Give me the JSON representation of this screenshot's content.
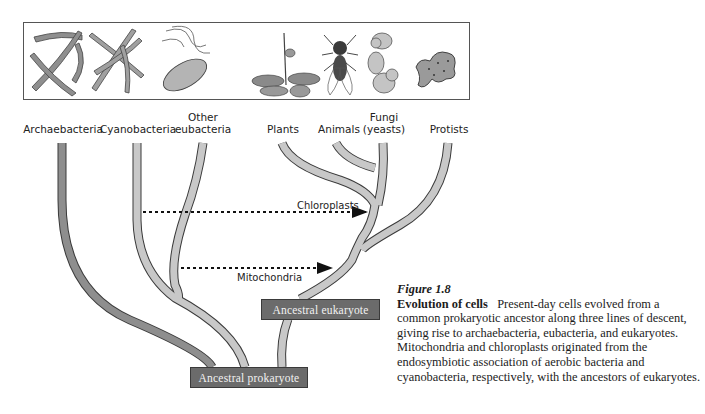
{
  "figure": {
    "number": "Figure 1.8",
    "title": "Evolution of cells",
    "caption": "Present-day cells evolved from a common prokaryotic ancestor along three lines of descent, giving rise to archaebacteria, eubacteria, and eukaryotes. Mitochondria and chloroplasts originated from the endosymbiotic association of aerobic bacteria and cyanobacteria, respectively, with the ancestors of eukaryotes."
  },
  "organism_panel": {
    "illustrations": [
      {
        "name": "archaebacteria-filaments",
        "icon": "filament-chain-icon"
      },
      {
        "name": "cyanobacteria-filaments",
        "icon": "bead-chain-icon"
      },
      {
        "name": "flagellated-bacterium",
        "icon": "rod-bacterium-icon"
      },
      {
        "name": "plant",
        "icon": "plant-icon"
      },
      {
        "name": "fruit-fly",
        "icon": "fly-icon"
      },
      {
        "name": "yeast-cells",
        "icon": "yeast-icon"
      },
      {
        "name": "amoeba",
        "icon": "amoeba-icon"
      }
    ]
  },
  "tree": {
    "leaves": [
      {
        "label": "Archaebacteria",
        "x": 63
      },
      {
        "label": "Cyanobacteria",
        "x": 138
      },
      {
        "label": "Other\neubacteria",
        "line1": "Other",
        "line2": "eubacteria",
        "x": 203
      },
      {
        "label": "Plants",
        "x": 283
      },
      {
        "label": "Animals",
        "x": 338
      },
      {
        "label": "Fungi\n(yeasts)",
        "line1": "Fungi",
        "line2": "(yeasts)",
        "x": 383
      },
      {
        "label": "Protists",
        "x": 448
      }
    ],
    "nodes": {
      "prokaryote": "Ancestral prokaryote",
      "eukaryote": "Ancestral eukaryote"
    },
    "transfers": {
      "chloroplasts": "Chloroplasts",
      "mitochondria": "Mitochondria"
    },
    "colors": {
      "archaea_branch": "#8e8e8e",
      "branch": "#c8c8c8",
      "outline": "#3a3a3a",
      "node_box": "#6b6b6b",
      "node_text": "#f2f2f2"
    }
  }
}
